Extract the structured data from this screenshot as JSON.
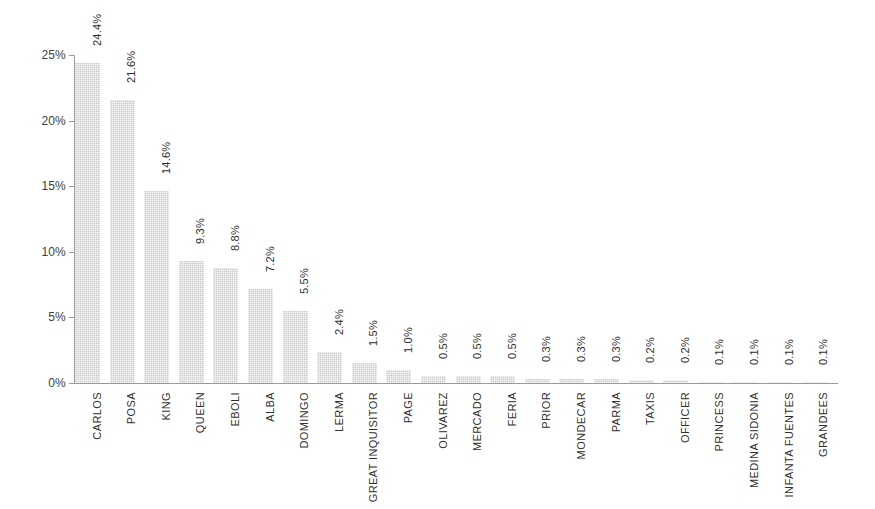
{
  "chart_data": {
    "type": "bar",
    "title": "",
    "subtitle": "",
    "xlabel": "",
    "ylabel": "",
    "ylim": [
      0,
      25
    ],
    "ytick_labels": [
      "0%",
      "5%",
      "10%",
      "15%",
      "20%",
      "25%"
    ],
    "ytick_values": [
      0,
      5,
      10,
      15,
      20,
      25
    ],
    "grid": false,
    "legend": "none",
    "bar_color": "#cdcdcd",
    "axis_color": "#9a9a9a",
    "text_color": "#303030",
    "value_label_rotation": "-90",
    "category_label_rotation": "-90",
    "categories": [
      "CARLOS",
      "POSA",
      "KING",
      "QUEEN",
      "EBOLI",
      "ALBA",
      "DOMINGO",
      "LERMA",
      "GREAT INQUISITOR",
      "PAGE",
      "OLIVAREZ",
      "MERCADO",
      "FERIA",
      "PRIOR",
      "MONDECAR",
      "PARMA",
      "TAXIS",
      "OFFICER",
      "PRINCESS",
      "MEDINA SIDONIA",
      "INFANTA FUENTES",
      "GRANDEES"
    ],
    "values": [
      24.4,
      21.6,
      14.6,
      9.3,
      8.8,
      7.2,
      5.5,
      2.4,
      1.5,
      1.0,
      0.5,
      0.5,
      0.5,
      0.3,
      0.3,
      0.3,
      0.2,
      0.2,
      0.1,
      0.1,
      0.1,
      0.1
    ],
    "value_labels": [
      "24.4%",
      "21.6%",
      "14.6%",
      "9.3%",
      "8.8%",
      "7.2%",
      "5.5%",
      "2.4%",
      "1.5%",
      "1.0%",
      "0.5%",
      "0.5%",
      "0.5%",
      "0.3%",
      "0.3%",
      "0.3%",
      "0.2%",
      "0.2%",
      "0.1%",
      "0.1%",
      "0.1%",
      "0.1%"
    ]
  }
}
